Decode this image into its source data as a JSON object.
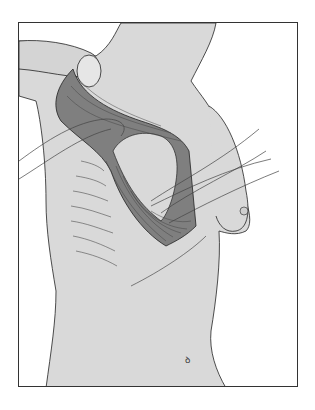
{
  "illustration": {
    "subject": "surgical anatomy illustration of lateral chest wall with muscle flap and retracted vessels",
    "colors": {
      "background": "#ffffff",
      "skin": "#d9d9d9",
      "muscle": "#7f7f7f",
      "muscle_dark": "#5a5a5a",
      "line": "#222222",
      "vessel": "#e8e8e8"
    }
  }
}
